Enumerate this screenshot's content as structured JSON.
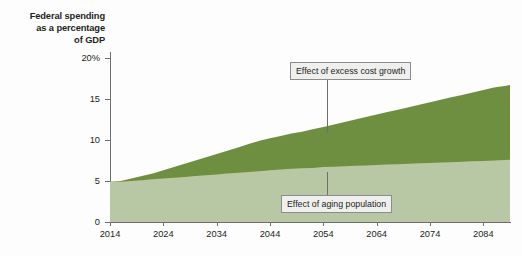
{
  "axis_title": {
    "line1": "Federal spending",
    "line2": "as a percentage",
    "line3": "of GDP"
  },
  "annotations": {
    "excess_cost": "Effect of excess cost growth",
    "aging": "Effect of aging population"
  },
  "colors": {
    "excess_cost_band": "#6f8f40",
    "aging_band": "#b9c8a4",
    "axis": "#6d6e71",
    "text": "#231f20",
    "callout_fill": "#efefee",
    "callout_border": "#8b8c8e",
    "background": "#fdfdfd"
  },
  "chart_data": {
    "type": "area",
    "title": "Federal spending as a percentage of GDP",
    "xlabel": "",
    "ylabel": "Federal spending as a percentage of GDP",
    "xlim": [
      2014,
      2089
    ],
    "ylim": [
      0,
      20
    ],
    "grid": false,
    "legend": "annotated-callouts",
    "stacked": true,
    "y_ticks": [
      0,
      5,
      10,
      15,
      20
    ],
    "y_ticklabels": [
      "0",
      "5",
      "10",
      "15",
      "20%"
    ],
    "x_ticks": [
      2014,
      2024,
      2034,
      2044,
      2054,
      2064,
      2074,
      2084
    ],
    "x_ticklabels": [
      "2014",
      "2024",
      "2034",
      "2044",
      "2054",
      "2064",
      "2074",
      "2084"
    ],
    "x": [
      2014,
      2016,
      2018,
      2020,
      2022,
      2024,
      2026,
      2028,
      2030,
      2032,
      2034,
      2036,
      2038,
      2040,
      2042,
      2044,
      2046,
      2048,
      2050,
      2052,
      2054,
      2056,
      2058,
      2060,
      2062,
      2064,
      2066,
      2068,
      2070,
      2072,
      2074,
      2076,
      2078,
      2080,
      2082,
      2084,
      2086,
      2088,
      2089
    ],
    "series": [
      {
        "name": "Effect of aging population",
        "note": "lower (pale sage) band, cumulative from 0",
        "values": [
          4.9,
          4.9,
          5.0,
          5.1,
          5.2,
          5.3,
          5.4,
          5.5,
          5.6,
          5.7,
          5.8,
          5.9,
          6.0,
          6.1,
          6.2,
          6.3,
          6.4,
          6.5,
          6.55,
          6.6,
          6.7,
          6.75,
          6.8,
          6.85,
          6.9,
          6.95,
          7.0,
          7.05,
          7.1,
          7.15,
          7.2,
          7.25,
          7.3,
          7.35,
          7.4,
          7.45,
          7.5,
          7.55,
          7.6
        ]
      },
      {
        "name": "Effect of excess cost growth",
        "note": "upper (olive green) band, cumulative total top boundary",
        "values": [
          4.9,
          5.0,
          5.3,
          5.6,
          5.9,
          6.3,
          6.7,
          7.1,
          7.5,
          7.9,
          8.3,
          8.7,
          9.1,
          9.5,
          9.9,
          10.2,
          10.5,
          10.8,
          11.0,
          11.3,
          11.6,
          11.9,
          12.2,
          12.5,
          12.8,
          13.1,
          13.4,
          13.7,
          14.0,
          14.3,
          14.6,
          14.9,
          15.2,
          15.5,
          15.8,
          16.1,
          16.4,
          16.6,
          16.7
        ]
      }
    ]
  }
}
